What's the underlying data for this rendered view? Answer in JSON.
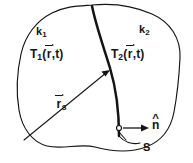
{
  "figure": {
    "kind": "line-diagram",
    "background_color": "#ffffff",
    "ink_color": "#141414",
    "width": 193,
    "height": 163
  },
  "regions": {
    "left": {
      "conductivity_label": "k",
      "conductivity_subscript": "1",
      "temperature_symbol": "T",
      "temperature_subscript": "2_placeholder_unused",
      "temperature_index": "1",
      "temperature_arg_vector": "r",
      "temperature_arg_rest": ",t)",
      "temperature_arg_open": "("
    },
    "right": {
      "conductivity_label": "k",
      "conductivity_subscript": "2",
      "temperature_symbol": "T",
      "temperature_index": "2",
      "temperature_arg_vector": "r",
      "temperature_arg_rest": ",t)",
      "temperature_arg_open": "("
    }
  },
  "annotations": {
    "position_vector": {
      "symbol": "r",
      "subscript": "s",
      "name": "surface position vector"
    },
    "normal_vector": {
      "symbol": "n",
      "accent": "^",
      "name": "outward unit normal"
    },
    "surface": {
      "label": "S",
      "name": "interface surface"
    }
  },
  "geometry": {
    "outer_boundary": "M 92,5 C 112,3 134,6 152,14 C 170,22 181,38 180,58 C 179,78 177,96 174,112 C 171,128 162,141 146,147 C 130,153 110,151 95,147 C 80,143 62,150 47,146 C 32,142 22,128 19,110 C 16,92 17,72 21,54 C 25,36 36,21 52,13 C 66,6 78,6 92,5 Z",
    "interface_curve": "M 92,6 C 96,26 104,48 110,68 C 116,88 119,112 119,136",
    "position_vector_arrow": {
      "x1": 24,
      "y1": 140,
      "x2": 110,
      "y2": 70
    },
    "normal_vector_arrow": {
      "x1": 124,
      "y1": 128,
      "x2": 147,
      "y2": 128
    },
    "normal_origin_dot": {
      "cx": 119,
      "cy": 128,
      "r": 2.4
    },
    "surface_leader": "M 119,136 C 124,142 132,145 140,143"
  }
}
